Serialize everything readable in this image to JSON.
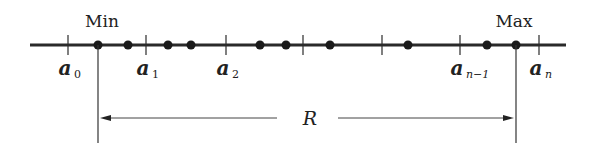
{
  "labels": {
    "min": "Min",
    "max": "Max",
    "range": "R"
  },
  "axis": {
    "x_start": 30,
    "x_end": 566,
    "y": 45,
    "color": "#2a2a2a"
  },
  "ticks": [
    {
      "x": 68,
      "base": "a",
      "sub": "0"
    },
    {
      "x": 146,
      "base": "a",
      "sub": "1"
    },
    {
      "x": 226,
      "base": "a",
      "sub": "2"
    },
    {
      "x": 303,
      "base": "",
      "sub": ""
    },
    {
      "x": 382,
      "base": "",
      "sub": ""
    },
    {
      "x": 460,
      "base": "a",
      "sub": "n-1"
    },
    {
      "x": 539,
      "base": "a",
      "sub": "n"
    }
  ],
  "points": [
    98,
    128,
    168,
    191,
    260,
    286,
    330,
    408,
    487,
    516
  ],
  "min_x": 98,
  "max_x": 516,
  "range_arrow_y": 118
}
